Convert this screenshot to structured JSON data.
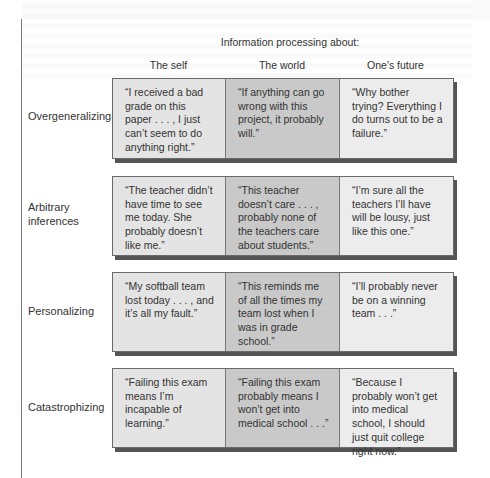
{
  "title": "Information processing about:",
  "columns": [
    "The self",
    "The world",
    "One's future"
  ],
  "rows": [
    {
      "label": "Overgeneralizing",
      "cells": [
        "“I received a bad grade on this paper . . . , I just can’t seem to do anything right.”",
        "“If anything can go wrong with this project, it probably will.”",
        "“Why bother trying? Everything I do turns out to be a failure.”"
      ]
    },
    {
      "label": "Arbitrary inferences",
      "cells": [
        "“The teacher didn’t have time to see me today. She probably doesn’t like me.”",
        "“This teacher doesn’t care . . . , probably none of the teachers care about students.”",
        "“I’m sure all the teachers I’ll have will be lousy, just like this one.”"
      ]
    },
    {
      "label": "Personalizing",
      "cells": [
        "“My softball team lost today . . . , and it’s all my fault.”",
        "“This reminds me of all the times my team lost when I was in grade school.”",
        "“I’ll probably never be on a winning team . . .”"
      ]
    },
    {
      "label": "Catastrophizing",
      "cells": [
        "“Failing this exam means I’m incapable of learning.”",
        "“Failing this exam probably means I won’t get into medical school . . .”",
        "“Because I probably won’t get into medical school, I should just quit college right now.”"
      ]
    }
  ],
  "colors": {
    "self_cell": "#e4e4e4",
    "world_cell": "#c9c9c9",
    "future_cell": "#ececec",
    "border": "#6a6a6a"
  }
}
